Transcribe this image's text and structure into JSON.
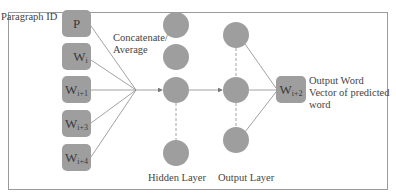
{
  "diagram": {
    "title_label": "Paragraph ID",
    "inputs": [
      {
        "id": "p",
        "base": "P",
        "sub": ""
      },
      {
        "id": "wi",
        "base": "W",
        "sub": "i"
      },
      {
        "id": "wi1",
        "base": "W",
        "sub": "i+1"
      },
      {
        "id": "wi3",
        "base": "W",
        "sub": "i+3"
      },
      {
        "id": "wi4",
        "base": "W",
        "sub": "i+4"
      }
    ],
    "concat_label_line1": "Concatenate/",
    "concat_label_line2": "Average",
    "hidden_layer_label": "Hidden Layer",
    "output_layer_label": "Output Layer",
    "output": {
      "base": "W",
      "sub": "i+2"
    },
    "output_desc_line1": "Output Word",
    "output_desc_line2": "Vector of predicted",
    "output_desc_line3": "word",
    "colors": {
      "node_fill": "#9e9e9e",
      "line": "#8a8a8a",
      "border": "#9a9a9a"
    }
  }
}
